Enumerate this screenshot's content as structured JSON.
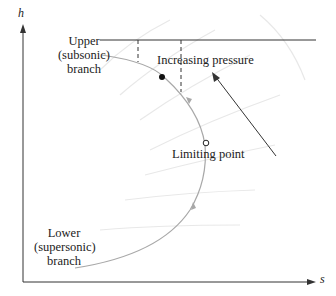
{
  "diagram": {
    "axes": {
      "x_label": "s",
      "y_label": "h"
    },
    "labels": {
      "upper_line1": "Upper",
      "upper_line2": "(subsonic)",
      "upper_line3": "branch",
      "lower_line1": "Lower",
      "lower_line2": "(supersonic)",
      "lower_line3": "branch",
      "increasing_pressure": "Increasing pressure",
      "limiting_point": "Limiting point"
    },
    "colors": {
      "axis": "#333333",
      "curve": "#a8a8a8",
      "isobar": "#e6e6e6",
      "arrow": "#333333",
      "point": "#111111"
    }
  }
}
